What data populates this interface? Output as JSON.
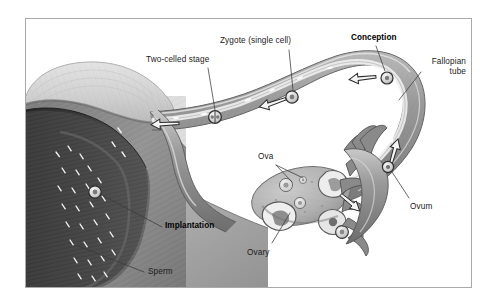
{
  "figure": {
    "kind": "anatomical-illustration",
    "style": "grayscale pencil/airbrush medical illustration",
    "border_color": "#a9a9a9",
    "background": "#ffffff"
  },
  "labels": {
    "two_celled_stage": "Two-celled stage",
    "zygote": "Zygote (single cell)",
    "conception": "Conception",
    "fallopian_tube_line1": "Fallopian",
    "fallopian_tube_line2": "tube",
    "ova": "Ova",
    "ovum": "Ovum",
    "implantation": "Implantation",
    "ovary": "Ovary",
    "sperm": "Sperm"
  },
  "emphasis": {
    "bold_labels": [
      "Conception",
      "Implantation"
    ],
    "regular_labels": [
      "Two-celled stage",
      "Zygote (single cell)",
      "Fallopian tube",
      "Ova",
      "Ovum",
      "Ovary",
      "Sperm"
    ]
  },
  "palette": {
    "ink": "#1a1a1a",
    "leader_line": "#333333",
    "fundus_light": "#d9d9d9",
    "myometrium_mid": "#9a9a9a",
    "endometrium_dark": "#4a4a4a",
    "cavity_shadow": "#2e2e2e",
    "tube_wall": "#8d8d8d",
    "tube_lumen": "#f2f2f2",
    "ovary_body": "#b5b5b5",
    "follicle_fill": "#e8e8e8",
    "fimbria": "#7e7e7e",
    "sperm_mark": "#ffffff",
    "arrow_fill": "#f5f5f5",
    "arrow_stroke": "#2b2b2b"
  },
  "structures": [
    {
      "name": "uterus-fundus",
      "note": "large pale dome upper left"
    },
    {
      "name": "uterine-cavity",
      "note": "dark triangular cavity with sperm"
    },
    {
      "name": "fallopian-tube",
      "note": "long curving duct from uterus to fimbriae"
    },
    {
      "name": "tube-lumen",
      "note": "pale channel inside the tube carrying the zygote"
    },
    {
      "name": "ovary",
      "note": "oval organ with multiple follicles"
    },
    {
      "name": "fimbriae",
      "note": "finger-like projections draping the ovary"
    },
    {
      "name": "broad-ligament",
      "note": "shaded sheet below the tube"
    }
  ],
  "cells": [
    {
      "name": "ovum-in-tube",
      "stage": "ovum",
      "note": "near fimbrial end"
    },
    {
      "name": "conception-cell",
      "stage": "fertilized",
      "note": "at ampulla curve"
    },
    {
      "name": "zygote-cell",
      "stage": "single cell"
    },
    {
      "name": "two-celled-cell",
      "stage": "two cells"
    },
    {
      "name": "implantation-cell",
      "stage": "blastocyst at uterine wall"
    },
    {
      "name": "released-ovum",
      "stage": "at ovary surface"
    }
  ],
  "flow_arrows": [
    {
      "name": "arrow-ampulla",
      "direction": "left"
    },
    {
      "name": "arrow-isthmus",
      "direction": "left"
    },
    {
      "name": "arrow-uterine",
      "direction": "left"
    },
    {
      "name": "arrow-fimbrial-up",
      "direction": "up"
    },
    {
      "name": "arrow-ovary-pickup",
      "direction": "up-right"
    }
  ]
}
